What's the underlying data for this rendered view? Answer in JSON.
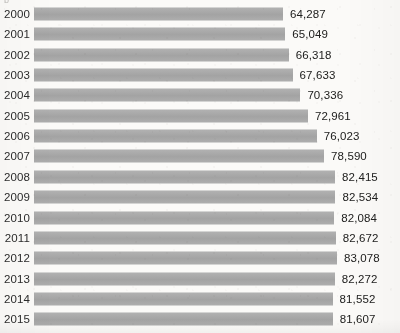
{
  "artifact": {
    "cut_off_glyph": "b"
  },
  "chart_data": {
    "type": "bar",
    "orientation": "horizontal",
    "title": "",
    "subtitle": "",
    "xlabel": "",
    "ylabel": "",
    "legend": [],
    "grid": false,
    "bar_color": "#a9a9a9",
    "background_color": "#fbfaf8",
    "text_color": "#20201f",
    "value_format": "comma-separated thousands",
    "categories": [
      "2000",
      "2001",
      "2002",
      "2003",
      "2004",
      "2005",
      "2006",
      "2007",
      "2008",
      "2009",
      "2010",
      "2011",
      "2012",
      "2013",
      "2014",
      "2015"
    ],
    "values": [
      64287,
      65049,
      66318,
      67633,
      70336,
      72961,
      76023,
      78590,
      82415,
      82534,
      82084,
      82672,
      83078,
      82272,
      81552,
      81607
    ],
    "value_labels": [
      "64,287",
      "65,049",
      "66,318",
      "67,633",
      "70,336",
      "72,961",
      "76,023",
      "78,590",
      "82,415",
      "82,534",
      "82,084",
      "82,672",
      "83,078",
      "82,272",
      "81,552",
      "81,607"
    ],
    "xlim": [
      0,
      83078
    ],
    "bar_axis_origin": 0,
    "rows": [
      {
        "year": "2000",
        "value": 64287,
        "label": "64,287"
      },
      {
        "year": "2001",
        "value": 65049,
        "label": "65,049"
      },
      {
        "year": "2002",
        "value": 66318,
        "label": "66,318"
      },
      {
        "year": "2003",
        "value": 67633,
        "label": "67,633"
      },
      {
        "year": "2004",
        "value": 70336,
        "label": "70,336"
      },
      {
        "year": "2005",
        "value": 72961,
        "label": "72,961"
      },
      {
        "year": "2006",
        "value": 76023,
        "label": "76,023"
      },
      {
        "year": "2007",
        "value": 78590,
        "label": "78,590"
      },
      {
        "year": "2008",
        "value": 82415,
        "label": "82,415"
      },
      {
        "year": "2009",
        "value": 82534,
        "label": "82,534"
      },
      {
        "year": "2010",
        "value": 82084,
        "label": "82,084"
      },
      {
        "year": "2011",
        "value": 82672,
        "label": "82,672"
      },
      {
        "year": "2012",
        "value": 83078,
        "label": "83,078"
      },
      {
        "year": "2013",
        "value": 82272,
        "label": "82,272"
      },
      {
        "year": "2014",
        "value": 81552,
        "label": "81,552"
      },
      {
        "year": "2015",
        "value": 81607,
        "label": "81,607"
      }
    ]
  }
}
